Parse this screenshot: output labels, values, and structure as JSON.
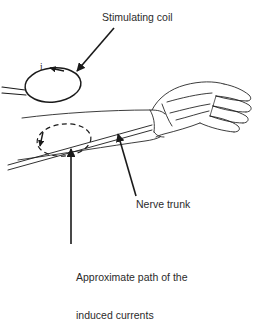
{
  "figure": {
    "background_color": "#ffffff",
    "ink_color": "#1a1a1a",
    "text_color": "#2b2b2b",
    "width": 260,
    "height": 283
  },
  "labels": {
    "stimulating_coil": "Stimulating coil",
    "nerve_trunk": "Nerve trunk",
    "induced_path_line1": "Approximate path of the",
    "induced_path_line2": "induced currents",
    "current_symbol": "i"
  },
  "elements": {
    "coil": "stimulating-coil-ellipse",
    "coil_leads": "coil-lead-wires",
    "coil_current_arrowhead": "coil-current-direction-arrow",
    "induced_loop": "induced-current-dashed-ellipse",
    "induced_current_arrowhead": "induced-current-direction-arrow",
    "nerve_trunk_band": "nerve-trunk-band",
    "arm": "forearm-outline",
    "hand": "hand-outline"
  },
  "leaders": {
    "stimulating_coil": "arrow pointing down-left to coil",
    "nerve_trunk": "arrow pointing up-left to nerve trunk",
    "induced_path": "arrow pointing up to dashed loop"
  }
}
